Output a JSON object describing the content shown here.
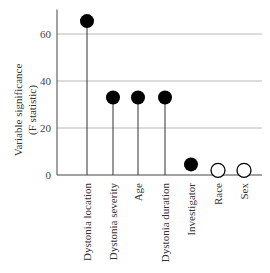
{
  "chart_data": {
    "type": "lollipop",
    "title": "",
    "xlabel": "",
    "ylabel": "Variable significance (F statistic)",
    "ylabel_lines": [
      "Variable significance",
      "(F statistic)"
    ],
    "ylim": [
      0,
      70
    ],
    "yticks": [
      0,
      20,
      40,
      60
    ],
    "grid": true,
    "categories": [
      "Dystonia location",
      "Dystonia severity",
      "Age",
      "Dystonia duration",
      "Investigator",
      "Race",
      "Sex"
    ],
    "values": [
      65.5,
      33,
      33,
      33,
      4.5,
      2,
      2
    ],
    "significant": [
      true,
      true,
      true,
      true,
      true,
      false,
      false
    ],
    "legend": []
  },
  "colors": {
    "marker_filled": "#000000",
    "marker_open": "#ffffff",
    "axis": "#444444",
    "grid": "#b8b8b8"
  }
}
